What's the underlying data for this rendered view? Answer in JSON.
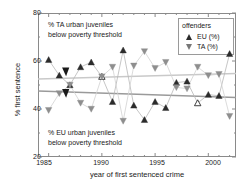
{
  "chart_data": {
    "type": "line",
    "title": "",
    "xlabel": "year of first sentenced crime",
    "ylabel": "% first sentence",
    "xlim": [
      1984,
      2002.6
    ],
    "ylim": [
      20,
      80
    ],
    "xticks": [
      1985,
      1990,
      1995,
      2000
    ],
    "yticks": [
      20,
      40,
      60,
      80
    ],
    "grid": false,
    "legend_position": "top-right",
    "legend_title": "offenders",
    "x": [
      1985,
      1986,
      1987,
      1988,
      1989,
      1990,
      1991,
      1992,
      1993,
      1994,
      1995,
      1996,
      1997,
      1998,
      1999,
      2000,
      2001,
      2002
    ],
    "series": [
      {
        "name": "EU (%)",
        "marker": "triangle-up",
        "color": "#2b2b2b",
        "values": [
          60.5,
          54.0,
          50.0,
          57.5,
          59.5,
          53.5,
          43.0,
          64.5,
          41.5,
          35.5,
          43.0,
          40.5,
          51.0,
          51.5,
          42.5,
          46.0,
          45.5,
          63.0
        ]
      },
      {
        "name": "TA (%)",
        "marker": "triangle-down",
        "color": "#8e8e8e",
        "values": [
          39.5,
          46.5,
          50.0,
          42.5,
          40.0,
          53.5,
          57.5,
          35.0,
          58.0,
          64.0,
          57.0,
          59.5,
          49.0,
          48.5,
          57.5,
          54.0,
          54.5,
          37.0
        ]
      }
    ],
    "trend_lines": [
      {
        "name": "TA urban juveniles below poverty threshold",
        "color": "#c9c9c9",
        "x": [
          1984,
          2002.6
        ],
        "y": [
          52.5,
          54.8
        ]
      },
      {
        "name": "EU urban juveniles below poverty threshold",
        "color": "#9a9a9a",
        "x": [
          1984,
          2002.6
        ],
        "y": [
          47.5,
          44.8
        ]
      }
    ],
    "annotations": [
      {
        "id": "ta-note",
        "line1": "% TA urban juveniles",
        "line2": "below poverty threshold"
      },
      {
        "id": "eu-note",
        "line1": "% EU urban juveniles",
        "line2": "below poverty threshold"
      }
    ],
    "pointer_markers": [
      {
        "label": "TA threshold pointer",
        "x": 1986.6,
        "y": 55.5
      },
      {
        "label": "EU threshold pointer",
        "x": 1986.6,
        "y": 46.5
      }
    ],
    "open_markers": [
      {
        "series": "EU (%)",
        "x": 1990,
        "y": 45.0
      },
      {
        "series": "EU (%)",
        "x": 1999,
        "y": 45.5
      }
    ]
  },
  "axes": {
    "x_title": "year of first sentenced crime",
    "y_title": "% first sentence",
    "x_tick_labels": [
      "1985",
      "1990",
      "1995",
      "2000"
    ],
    "y_tick_labels": [
      "20",
      "40",
      "60",
      "80"
    ]
  },
  "legend": {
    "title": "offenders",
    "entries": [
      {
        "label": "EU (%)",
        "marker": "triangle-up"
      },
      {
        "label": "TA (%)",
        "marker": "triangle-down"
      }
    ]
  },
  "annotations": {
    "top": {
      "line1": "% TA urban juveniles",
      "line2": "below poverty threshold"
    },
    "bottom": {
      "line1": "% EU urban juveniles",
      "line2": "below poverty threshold"
    }
  },
  "colors": {
    "eu_marker": "#2b2b2b",
    "ta_marker": "#8e8e8e",
    "axis": "#8a8a8a",
    "trend_ta": "#c9c9c9",
    "trend_eu": "#9a9a9a",
    "background": "#ffffff"
  }
}
